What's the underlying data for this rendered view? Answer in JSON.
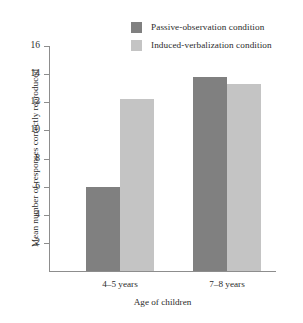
{
  "chart_data": {
    "type": "bar",
    "title": "",
    "subtitle": "",
    "xlabel": "Age of children",
    "ylabel": "Mean number of responses correctly reproduced",
    "categories": [
      "4–5 years",
      "7–8 years"
    ],
    "series": [
      {
        "name": "Passive-observation condition",
        "color": "#808080",
        "values": [
          6.0,
          13.8
        ]
      },
      {
        "name": "Induced-verbalization condition",
        "color": "#c4c4c4",
        "values": [
          12.2,
          13.3
        ]
      }
    ],
    "ylim": [
      0,
      16
    ],
    "yticks": [
      2,
      4,
      6,
      8,
      10,
      12,
      14,
      16
    ],
    "ytick_labels": [
      "2",
      "4",
      "6",
      "8",
      "10",
      "12",
      "14",
      "16"
    ],
    "grid": false,
    "legend_position": "top-right",
    "axis_color": "#8d8d8d"
  }
}
